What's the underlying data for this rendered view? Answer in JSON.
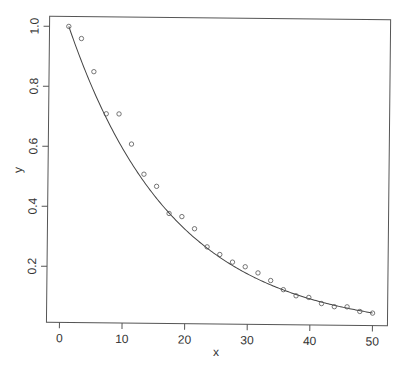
{
  "chart_data": {
    "type": "scatter",
    "title": "",
    "xlabel": "x",
    "ylabel": "y",
    "xlim": [
      -1.5,
      52
    ],
    "ylim": [
      0.02,
      1.04
    ],
    "x_ticks": [
      0,
      10,
      20,
      30,
      40,
      50
    ],
    "y_ticks": [
      0.2,
      0.4,
      0.6,
      0.8,
      1.0
    ],
    "x_tick_labels": [
      "0",
      "10",
      "20",
      "30",
      "40",
      "50"
    ],
    "y_tick_labels": [
      "0.2",
      "0.4",
      "0.6",
      "0.8",
      "1.0"
    ],
    "grid": false,
    "legend": null,
    "series": [
      {
        "name": "observed",
        "kind": "points",
        "marker": "open-circle",
        "x": [
          1,
          3.04,
          5.08,
          7.13,
          9.17,
          11.21,
          13.25,
          15.29,
          17.33,
          19.38,
          21.42,
          23.46,
          25.5,
          27.54,
          29.58,
          31.63,
          33.67,
          35.71,
          37.75,
          39.79,
          41.83,
          43.88,
          45.92,
          47.96,
          50
        ],
        "y": [
          1.0,
          0.96,
          0.85,
          0.71,
          0.71,
          0.61,
          0.51,
          0.47,
          0.38,
          0.37,
          0.33,
          0.27,
          0.245,
          0.22,
          0.205,
          0.185,
          0.16,
          0.13,
          0.11,
          0.105,
          0.085,
          0.075,
          0.075,
          0.06,
          0.055
        ]
      },
      {
        "name": "fitted curve",
        "kind": "line",
        "formula": "y = exp(-0.059 * (x - 1))",
        "rate": 0.059,
        "x_start": 1,
        "x_end": 50
      }
    ]
  }
}
